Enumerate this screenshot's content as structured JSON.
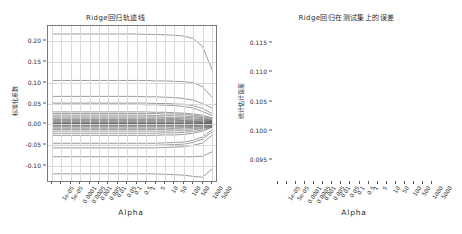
{
  "figure": {
    "width": 462,
    "height": 234,
    "background": "#ffffff",
    "line_color": "#4a4a4a",
    "grid_color": "#d9d9d9",
    "axis_color": "#7a7a7a"
  },
  "chart_data": [
    {
      "id": "ridge-trace",
      "type": "line",
      "title": "Ridge回归轨迹线",
      "xlabel": "Alpha",
      "ylabel": "标准化系数",
      "grid": true,
      "legend": "none",
      "x": [
        "1e-05",
        "5e-05",
        "0.0001",
        "0.0005",
        "0.001",
        "0.005",
        "0.01",
        "0.05",
        "0.1",
        "0.5",
        "1",
        "5",
        "10",
        "50",
        "100",
        "500",
        "1000",
        "5000"
      ],
      "xtick_labels": [
        "1e-05",
        "5e-05",
        "0.0001",
        "0.0005",
        "0.001",
        "0.005",
        "0.01",
        "0.05",
        "0.1",
        "0.5",
        "1",
        "5",
        "10",
        "50",
        "100",
        "500",
        "1000",
        "5000"
      ],
      "ytick_labels": [
        "0.20",
        "0.15",
        "0.10",
        "0.05",
        "0.00",
        "-0.05",
        "-0.10"
      ],
      "ytick_values": [
        0.2,
        0.15,
        0.1,
        0.05,
        0.0,
        -0.05,
        -0.1
      ],
      "ylim": [
        -0.135,
        0.235
      ],
      "series": [
        {
          "name": "coef_01",
          "values": [
            0.216,
            0.216,
            0.216,
            0.216,
            0.216,
            0.216,
            0.216,
            0.216,
            0.216,
            0.216,
            0.215,
            0.215,
            0.214,
            0.213,
            0.211,
            0.205,
            0.186,
            0.131
          ]
        },
        {
          "name": "coef_02",
          "values": [
            0.105,
            0.105,
            0.105,
            0.105,
            0.105,
            0.105,
            0.105,
            0.105,
            0.105,
            0.105,
            0.105,
            0.104,
            0.104,
            0.103,
            0.102,
            0.1,
            0.09,
            0.065
          ]
        },
        {
          "name": "coef_03",
          "values": [
            0.067,
            0.067,
            0.067,
            0.067,
            0.067,
            0.067,
            0.067,
            0.067,
            0.067,
            0.067,
            0.066,
            0.066,
            0.065,
            0.064,
            0.062,
            0.058,
            0.05,
            0.039
          ]
        },
        {
          "name": "coef_04",
          "values": [
            0.051,
            0.051,
            0.051,
            0.051,
            0.051,
            0.051,
            0.051,
            0.051,
            0.051,
            0.051,
            0.051,
            0.05,
            0.05,
            0.049,
            0.048,
            0.045,
            0.038,
            0.026
          ]
        },
        {
          "name": "coef_05",
          "values": [
            0.048,
            0.048,
            0.048,
            0.048,
            0.048,
            0.048,
            0.048,
            0.048,
            0.048,
            0.048,
            0.047,
            0.047,
            0.046,
            0.045,
            0.043,
            0.039,
            0.031,
            0.021
          ]
        },
        {
          "name": "coef_06",
          "values": [
            0.03,
            0.03,
            0.03,
            0.03,
            0.03,
            0.03,
            0.03,
            0.03,
            0.03,
            0.03,
            0.03,
            0.029,
            0.029,
            0.028,
            0.027,
            0.025,
            0.022,
            0.016
          ]
        },
        {
          "name": "coef_07",
          "values": [
            0.026,
            0.026,
            0.026,
            0.026,
            0.026,
            0.026,
            0.026,
            0.026,
            0.026,
            0.026,
            0.026,
            0.026,
            0.025,
            0.025,
            0.024,
            0.022,
            0.019,
            0.014
          ]
        },
        {
          "name": "coef_08",
          "values": [
            0.022,
            0.022,
            0.022,
            0.022,
            0.022,
            0.022,
            0.022,
            0.022,
            0.022,
            0.022,
            0.022,
            0.021,
            0.021,
            0.021,
            0.02,
            0.019,
            0.016,
            0.012
          ]
        },
        {
          "name": "coef_09",
          "values": [
            0.018,
            0.018,
            0.018,
            0.018,
            0.018,
            0.018,
            0.018,
            0.018,
            0.018,
            0.018,
            0.018,
            0.018,
            0.017,
            0.017,
            0.017,
            0.016,
            0.014,
            0.01
          ]
        },
        {
          "name": "coef_10",
          "values": [
            0.015,
            0.015,
            0.015,
            0.015,
            0.015,
            0.015,
            0.015,
            0.015,
            0.015,
            0.015,
            0.015,
            0.015,
            0.015,
            0.014,
            0.014,
            0.013,
            0.012,
            0.009
          ]
        },
        {
          "name": "coef_11",
          "values": [
            0.012,
            0.012,
            0.012,
            0.012,
            0.012,
            0.012,
            0.012,
            0.012,
            0.012,
            0.012,
            0.012,
            0.012,
            0.012,
            0.012,
            0.011,
            0.011,
            0.01,
            0.008
          ]
        },
        {
          "name": "coef_12",
          "values": [
            0.01,
            0.01,
            0.01,
            0.01,
            0.01,
            0.01,
            0.01,
            0.01,
            0.01,
            0.01,
            0.01,
            0.01,
            0.01,
            0.01,
            0.009,
            0.009,
            0.008,
            0.007
          ]
        },
        {
          "name": "coef_13",
          "values": [
            0.008,
            0.008,
            0.008,
            0.008,
            0.008,
            0.008,
            0.008,
            0.008,
            0.008,
            0.008,
            0.008,
            0.008,
            0.008,
            0.008,
            0.008,
            0.007,
            0.007,
            0.006
          ]
        },
        {
          "name": "coef_14",
          "values": [
            0.006,
            0.006,
            0.006,
            0.006,
            0.006,
            0.006,
            0.006,
            0.006,
            0.006,
            0.006,
            0.006,
            0.006,
            0.006,
            0.006,
            0.006,
            0.006,
            0.005,
            0.005
          ]
        },
        {
          "name": "coef_15",
          "values": [
            0.004,
            0.004,
            0.004,
            0.004,
            0.004,
            0.004,
            0.004,
            0.004,
            0.004,
            0.004,
            0.004,
            0.004,
            0.004,
            0.004,
            0.004,
            0.004,
            0.004,
            0.004
          ]
        },
        {
          "name": "coef_16",
          "values": [
            0.003,
            0.003,
            0.003,
            0.003,
            0.003,
            0.003,
            0.003,
            0.003,
            0.003,
            0.003,
            0.003,
            0.003,
            0.003,
            0.003,
            0.003,
            0.003,
            0.003,
            0.003
          ]
        },
        {
          "name": "coef_17",
          "values": [
            0.002,
            0.002,
            0.002,
            0.002,
            0.002,
            0.002,
            0.002,
            0.002,
            0.002,
            0.002,
            0.002,
            0.002,
            0.002,
            0.002,
            0.002,
            0.002,
            0.002,
            0.002
          ]
        },
        {
          "name": "coef_18",
          "values": [
            0.001,
            0.001,
            0.001,
            0.001,
            0.001,
            0.001,
            0.001,
            0.001,
            0.001,
            0.001,
            0.001,
            0.001,
            0.001,
            0.001,
            0.001,
            0.001,
            0.001,
            0.002
          ]
        },
        {
          "name": "coef_19",
          "values": [
            0.0,
            0.0,
            0.0,
            0.0,
            0.0,
            0.0,
            0.0,
            0.0,
            0.0,
            0.0,
            0.0,
            0.0,
            0.0,
            0.0,
            0.0,
            0.0,
            0.001,
            0.001
          ]
        },
        {
          "name": "coef_20",
          "values": [
            -0.001,
            -0.001,
            -0.001,
            -0.001,
            -0.001,
            -0.001,
            -0.001,
            -0.001,
            -0.001,
            -0.001,
            -0.001,
            -0.001,
            -0.001,
            -0.001,
            -0.001,
            -0.001,
            0.0,
            0.001
          ]
        },
        {
          "name": "coef_21",
          "values": [
            -0.002,
            -0.002,
            -0.002,
            -0.002,
            -0.002,
            -0.002,
            -0.002,
            -0.002,
            -0.002,
            -0.002,
            -0.002,
            -0.002,
            -0.002,
            -0.002,
            -0.002,
            -0.002,
            -0.001,
            0.0
          ]
        },
        {
          "name": "coef_22",
          "values": [
            -0.004,
            -0.004,
            -0.004,
            -0.004,
            -0.004,
            -0.004,
            -0.004,
            -0.004,
            -0.004,
            -0.004,
            -0.004,
            -0.004,
            -0.004,
            -0.004,
            -0.004,
            -0.003,
            -0.003,
            -0.001
          ]
        },
        {
          "name": "coef_23",
          "values": [
            -0.006,
            -0.006,
            -0.006,
            -0.006,
            -0.006,
            -0.006,
            -0.006,
            -0.006,
            -0.006,
            -0.006,
            -0.006,
            -0.006,
            -0.006,
            -0.006,
            -0.006,
            -0.005,
            -0.004,
            -0.002
          ]
        },
        {
          "name": "coef_24",
          "values": [
            -0.009,
            -0.009,
            -0.009,
            -0.009,
            -0.009,
            -0.009,
            -0.009,
            -0.009,
            -0.009,
            -0.009,
            -0.009,
            -0.009,
            -0.009,
            -0.009,
            -0.008,
            -0.007,
            -0.006,
            -0.003
          ]
        },
        {
          "name": "coef_25",
          "values": [
            -0.012,
            -0.012,
            -0.012,
            -0.012,
            -0.012,
            -0.012,
            -0.012,
            -0.012,
            -0.012,
            -0.012,
            -0.012,
            -0.012,
            -0.012,
            -0.011,
            -0.011,
            -0.01,
            -0.008,
            -0.004
          ]
        },
        {
          "name": "coef_26",
          "values": [
            -0.016,
            -0.016,
            -0.016,
            -0.016,
            -0.016,
            -0.016,
            -0.016,
            -0.016,
            -0.016,
            -0.016,
            -0.016,
            -0.016,
            -0.016,
            -0.015,
            -0.015,
            -0.013,
            -0.01,
            -0.005
          ]
        },
        {
          "name": "coef_27",
          "values": [
            -0.021,
            -0.021,
            -0.021,
            -0.021,
            -0.021,
            -0.021,
            -0.021,
            -0.021,
            -0.021,
            -0.021,
            -0.021,
            -0.021,
            -0.02,
            -0.02,
            -0.019,
            -0.017,
            -0.013,
            -0.006
          ]
        },
        {
          "name": "coef_28",
          "values": [
            -0.026,
            -0.026,
            -0.026,
            -0.026,
            -0.026,
            -0.026,
            -0.026,
            -0.026,
            -0.026,
            -0.026,
            -0.026,
            -0.026,
            -0.025,
            -0.025,
            -0.024,
            -0.021,
            -0.016,
            -0.007
          ]
        },
        {
          "name": "coef_29",
          "values": [
            -0.045,
            -0.045,
            -0.045,
            -0.045,
            -0.045,
            -0.045,
            -0.045,
            -0.045,
            -0.045,
            -0.045,
            -0.045,
            -0.045,
            -0.044,
            -0.043,
            -0.042,
            -0.038,
            -0.03,
            -0.013
          ]
        },
        {
          "name": "coef_30",
          "values": [
            -0.05,
            -0.05,
            -0.05,
            -0.05,
            -0.05,
            -0.05,
            -0.05,
            -0.05,
            -0.05,
            -0.05,
            -0.05,
            -0.05,
            -0.049,
            -0.048,
            -0.047,
            -0.043,
            -0.035,
            -0.018
          ]
        },
        {
          "name": "coef_31",
          "values": [
            -0.056,
            -0.056,
            -0.056,
            -0.056,
            -0.056,
            -0.056,
            -0.056,
            -0.056,
            -0.056,
            -0.056,
            -0.056,
            -0.056,
            -0.055,
            -0.054,
            -0.053,
            -0.05,
            -0.044,
            -0.026
          ]
        },
        {
          "name": "coef_32",
          "values": [
            -0.077,
            -0.077,
            -0.077,
            -0.077,
            -0.077,
            -0.077,
            -0.077,
            -0.077,
            -0.077,
            -0.077,
            -0.077,
            -0.077,
            -0.077,
            -0.077,
            -0.077,
            -0.077,
            -0.076,
            -0.065
          ]
        },
        {
          "name": "coef_33",
          "values": [
            -0.118,
            -0.118,
            -0.118,
            -0.118,
            -0.118,
            -0.118,
            -0.118,
            -0.118,
            -0.118,
            -0.118,
            -0.118,
            -0.118,
            -0.119,
            -0.12,
            -0.121,
            -0.124,
            -0.126,
            -0.106
          ]
        }
      ]
    },
    {
      "id": "ridge-test-error",
      "type": "line",
      "title": "Ridge回归在测试集上的误差",
      "xlabel": "Alpha",
      "ylabel": "统计估计误差",
      "grid": true,
      "legend": "none",
      "marker": "square",
      "x": [
        "1e-05",
        "5e-05",
        "0.0001",
        "0.0005",
        "0.001",
        "0.005",
        "0.01",
        "0.05",
        "0.1",
        "0.5",
        "1",
        "5",
        "10",
        "50",
        "100",
        "500",
        "1000",
        "5000"
      ],
      "xtick_labels": [
        "1e-05",
        "5e-05",
        "0.0001",
        "0.0005",
        "0.001",
        "0.005",
        "0.01",
        "0.05",
        "0.1",
        "0.5",
        "1",
        "5",
        "10",
        "50",
        "100",
        "500",
        "1000",
        "5000"
      ],
      "ytick_labels": [
        "0.115",
        "0.110",
        "0.105",
        "0.100",
        "0.095"
      ],
      "ytick_values": [
        0.115,
        0.11,
        0.105,
        0.1,
        0.095
      ],
      "ylim": [
        0.0915,
        0.1175
      ],
      "values": [
        0.0932,
        0.0932,
        0.0932,
        0.0932,
        0.0932,
        0.0932,
        0.0932,
        0.0931,
        0.0931,
        0.0931,
        0.0931,
        0.093,
        0.093,
        0.0929,
        0.0928,
        0.0928,
        0.0941,
        0.1165
      ]
    }
  ]
}
